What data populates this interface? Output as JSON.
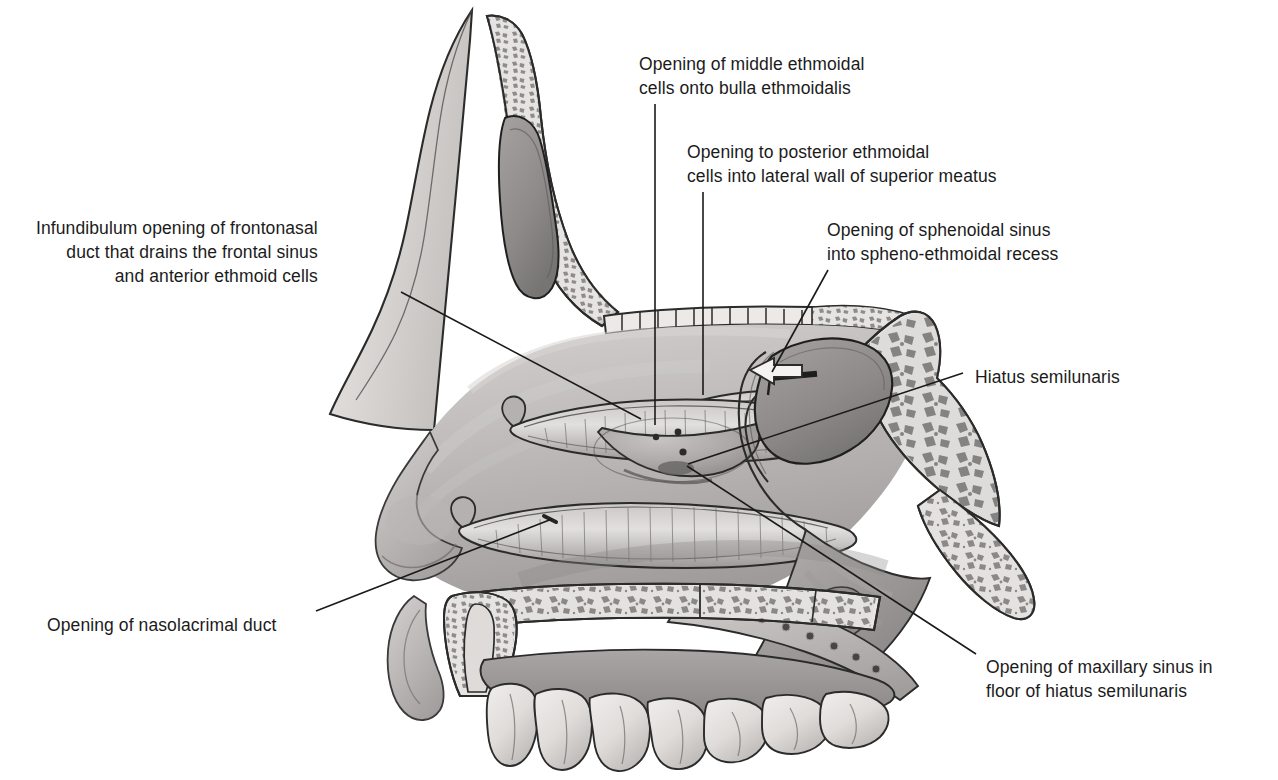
{
  "figure": {
    "background_color": "#ffffff",
    "text_color": "#1b1b1b",
    "line_color": "#1a1a1a"
  },
  "labels": [
    {
      "id": "middle-ethmoidal",
      "text": "Opening of middle ethmoidal\ncells onto bulla ethmoidalis",
      "align": "left",
      "x": 639,
      "y": 52,
      "leader": {
        "x1": 655,
        "y1": 104,
        "x2": 655,
        "y2": 425
      }
    },
    {
      "id": "posterior-ethmoidal",
      "text": "Opening to posterior ethmoidal\ncells into lateral wall of superior meatus",
      "align": "left",
      "x": 687,
      "y": 140,
      "leader": {
        "x1": 703,
        "y1": 192,
        "x2": 703,
        "y2": 395
      }
    },
    {
      "id": "sphenoidal-sinus",
      "text": "Opening of sphenoidal sinus\ninto spheno-ethmoidal recess",
      "align": "left",
      "x": 827,
      "y": 218,
      "leader": {
        "x1": 828,
        "y1": 270,
        "x2": 772,
        "y2": 372
      }
    },
    {
      "id": "infundibulum",
      "text": "Infundibulum opening of frontonasal\nduct that drains the frontal sinus\nand anterior ethmoid cells",
      "align": "right",
      "x": 36,
      "y": 216,
      "leader": {
        "x1": 401,
        "y1": 292,
        "x2": 641,
        "y2": 419
      }
    },
    {
      "id": "hiatus-semilunaris",
      "text": "Hiatus semilunaris",
      "align": "left",
      "x": 975,
      "y": 365,
      "leader": {
        "x1": 963,
        "y1": 373,
        "x2": 688,
        "y2": 464
      }
    },
    {
      "id": "nasolacrimal-duct",
      "text": "Opening of nasolacrimal duct",
      "align": "left",
      "x": 47,
      "y": 613,
      "leader": {
        "x1": 316,
        "y1": 611,
        "x2": 552,
        "y2": 519
      }
    },
    {
      "id": "maxillary-sinus",
      "text": "Opening of maxillary sinus in\nfloor of hiatus semilunaris",
      "align": "left",
      "x": 986,
      "y": 655,
      "leader": {
        "x1": 976,
        "y1": 654,
        "x2": 687,
        "y2": 466
      }
    }
  ],
  "structures": [
    {
      "id": "frontal-sinus",
      "name": "Frontal sinus"
    },
    {
      "id": "frontal-bone-diploe",
      "name": "Frontal bone diploe"
    },
    {
      "id": "cribriform-plate",
      "name": "Cribriform plate"
    },
    {
      "id": "superior-concha",
      "name": "Superior nasal concha"
    },
    {
      "id": "middle-concha",
      "name": "Middle nasal concha"
    },
    {
      "id": "inferior-concha",
      "name": "Inferior nasal concha"
    },
    {
      "id": "bulla-ethmoidalis",
      "name": "Bulla ethmoidalis"
    },
    {
      "id": "sphenoid-sinus",
      "name": "Sphenoidal sinus"
    },
    {
      "id": "sphenoid-body",
      "name": "Body of sphenoid"
    },
    {
      "id": "pterygoid-process",
      "name": "Pterygoid process"
    },
    {
      "id": "hard-palate",
      "name": "Hard palate"
    },
    {
      "id": "soft-palate",
      "name": "Soft palate"
    },
    {
      "id": "nasopharynx",
      "name": "Nasopharynx"
    },
    {
      "id": "upper-teeth",
      "name": "Upper teeth"
    },
    {
      "id": "nostril",
      "name": "Nostril / vestibule"
    },
    {
      "id": "superior-meatus-arrow",
      "name": "Superior meatus arrow"
    },
    {
      "id": "sphenoid-probe",
      "name": "Sphenoid sinus probe marker"
    }
  ]
}
